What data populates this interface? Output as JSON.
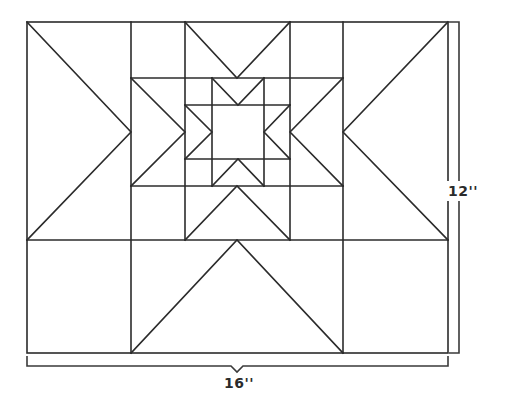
{
  "diagram": {
    "stroke_color": "#2b2b2b",
    "background": "#ffffff",
    "outer_frame": {
      "x1": 27,
      "y1": 22,
      "x2": 448,
      "y2": 353
    },
    "dimensions": {
      "height_label": "12''",
      "width_label": "16''"
    }
  }
}
